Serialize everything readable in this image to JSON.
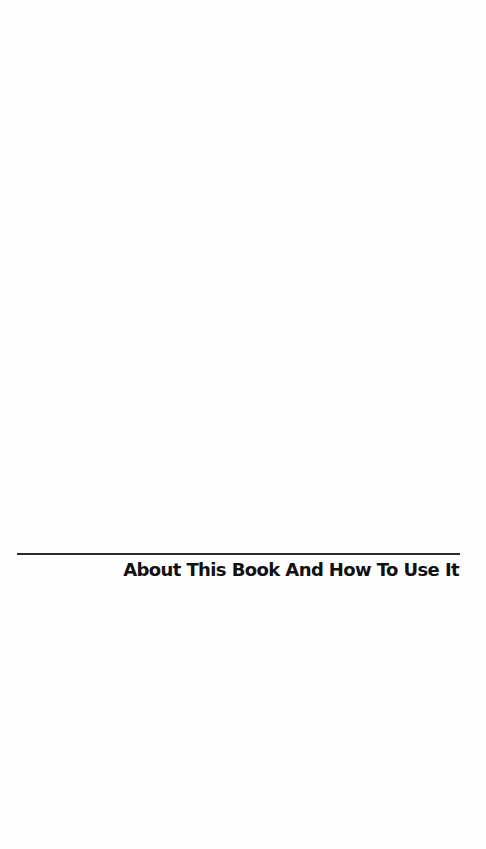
{
  "page": {
    "section_heading": "About This Book And How To Use It",
    "colors": {
      "background": "#fefefe",
      "rule": "#2a2a2a",
      "text": "#111111"
    }
  }
}
